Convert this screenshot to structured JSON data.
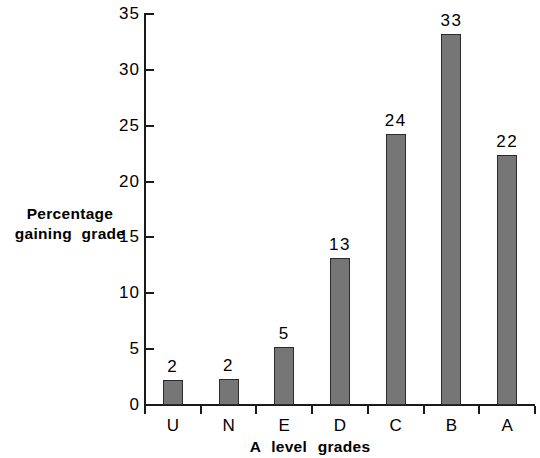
{
  "chart_data": {
    "type": "bar",
    "title": "",
    "xlabel": "A  level  grades",
    "ylabel_line1": "Percentage",
    "ylabel_line2": "gaining  grade",
    "categories": [
      "U",
      "N",
      "E",
      "D",
      "C",
      "B",
      "A"
    ],
    "values": [
      2.2,
      2.3,
      5.2,
      13.2,
      24.3,
      33.2,
      22.4
    ],
    "data_labels": [
      "2",
      "2",
      "5",
      "13",
      "24",
      "33",
      "22"
    ],
    "ylim": [
      0,
      35
    ],
    "yticks": [
      0,
      5,
      10,
      15,
      20,
      25,
      30,
      35
    ],
    "ytick_labels": [
      "0",
      "5",
      "10",
      "15",
      "20",
      "25",
      "30",
      "35"
    ],
    "grid": false,
    "legend": "none",
    "bar_fill": "#767676",
    "bar_stroke": "#2b2b2b",
    "axis_color": "#1a1a1a"
  }
}
